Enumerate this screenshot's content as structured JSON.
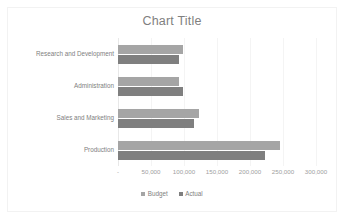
{
  "chart_data": {
    "type": "bar",
    "orientation": "horizontal",
    "title": "Chart Title",
    "xlabel": "",
    "ylabel": "",
    "categories": [
      "Research and Development",
      "Administration",
      "Sales and Marketing",
      "Production"
    ],
    "series": [
      {
        "name": "Budget",
        "color": "#a5a5a5",
        "values": [
          98000,
          92000,
          122000,
          245000
        ]
      },
      {
        "name": "Actual",
        "color": "#7f7f7f",
        "values": [
          92000,
          98000,
          115000,
          222000
        ]
      }
    ],
    "xlim": [
      0,
      300000
    ],
    "xticks": [
      0,
      50000,
      100000,
      150000,
      200000,
      250000,
      300000
    ],
    "xtick_labels": [
      " - ",
      "50,000",
      "100,000",
      "150,000",
      "200,000",
      "250,000",
      "300,000"
    ],
    "grid": true,
    "grid_axis": "x",
    "legend": [
      "Budget",
      "Actual"
    ],
    "legend_position": "bottom"
  },
  "colors": {
    "budget": "#a5a5a5",
    "actual": "#7f7f7f",
    "title_text": "#7f7f7f",
    "label_text": "#808080",
    "gridline": "#f4f4f4",
    "frame": "#f2f2f2",
    "background": "#ffffff"
  }
}
